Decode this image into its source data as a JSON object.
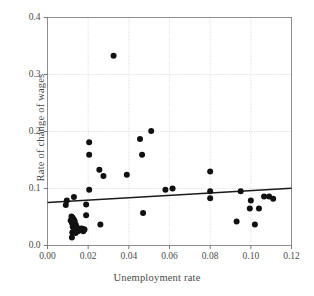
{
  "chart_data": {
    "type": "scatter",
    "title": "",
    "xlabel": "Unemployment rate",
    "ylabel": "Rate of change of wages",
    "xlim": [
      0.0,
      0.12
    ],
    "ylim": [
      0.0,
      0.4
    ],
    "xticks": [
      "0.00",
      "0.02",
      "0.04",
      "0.06",
      "0.08",
      "0.10",
      "0.12"
    ],
    "xtick_values": [
      0.0,
      0.02,
      0.04,
      0.06,
      0.08,
      0.1,
      0.12
    ],
    "yticks": [
      "0.0",
      "0.1",
      "0.2",
      "0.3",
      "0.4"
    ],
    "ytick_values": [
      0.0,
      0.1,
      0.2,
      0.3,
      0.4
    ],
    "grid": true,
    "grid_color": "#cccccc",
    "legend": "none",
    "marker_color": "#111111",
    "marker_size": 3.0,
    "line_color": "#1a1a1a",
    "points": [
      {
        "x": 0.0325,
        "y": 0.333
      },
      {
        "x": 0.0205,
        "y": 0.181
      },
      {
        "x": 0.0205,
        "y": 0.159
      },
      {
        "x": 0.0455,
        "y": 0.187
      },
      {
        "x": 0.0465,
        "y": 0.159
      },
      {
        "x": 0.051,
        "y": 0.201
      },
      {
        "x": 0.0255,
        "y": 0.133
      },
      {
        "x": 0.0275,
        "y": 0.122
      },
      {
        "x": 0.039,
        "y": 0.124
      },
      {
        "x": 0.08,
        "y": 0.13
      },
      {
        "x": 0.0205,
        "y": 0.098
      },
      {
        "x": 0.058,
        "y": 0.098
      },
      {
        "x": 0.0615,
        "y": 0.1
      },
      {
        "x": 0.08,
        "y": 0.095
      },
      {
        "x": 0.095,
        "y": 0.095
      },
      {
        "x": 0.08,
        "y": 0.083
      },
      {
        "x": 0.013,
        "y": 0.085
      },
      {
        "x": 0.0095,
        "y": 0.079
      },
      {
        "x": 0.009,
        "y": 0.071
      },
      {
        "x": 0.019,
        "y": 0.072
      },
      {
        "x": 0.1,
        "y": 0.079
      },
      {
        "x": 0.1065,
        "y": 0.086
      },
      {
        "x": 0.109,
        "y": 0.086
      },
      {
        "x": 0.111,
        "y": 0.082
      },
      {
        "x": 0.0995,
        "y": 0.065
      },
      {
        "x": 0.104,
        "y": 0.065
      },
      {
        "x": 0.019,
        "y": 0.053
      },
      {
        "x": 0.047,
        "y": 0.057
      },
      {
        "x": 0.093,
        "y": 0.042
      },
      {
        "x": 0.102,
        "y": 0.037
      },
      {
        "x": 0.026,
        "y": 0.037
      },
      {
        "x": 0.0118,
        "y": 0.051
      },
      {
        "x": 0.0122,
        "y": 0.049
      },
      {
        "x": 0.0126,
        "y": 0.047
      },
      {
        "x": 0.013,
        "y": 0.045
      },
      {
        "x": 0.0114,
        "y": 0.044
      },
      {
        "x": 0.0134,
        "y": 0.042
      },
      {
        "x": 0.012,
        "y": 0.04
      },
      {
        "x": 0.0128,
        "y": 0.038
      },
      {
        "x": 0.014,
        "y": 0.036
      },
      {
        "x": 0.0124,
        "y": 0.033
      },
      {
        "x": 0.0132,
        "y": 0.031
      },
      {
        "x": 0.0155,
        "y": 0.03
      },
      {
        "x": 0.0168,
        "y": 0.03
      },
      {
        "x": 0.0175,
        "y": 0.029
      },
      {
        "x": 0.0162,
        "y": 0.027
      },
      {
        "x": 0.015,
        "y": 0.025
      },
      {
        "x": 0.0128,
        "y": 0.025
      },
      {
        "x": 0.0176,
        "y": 0.025
      },
      {
        "x": 0.0182,
        "y": 0.028
      },
      {
        "x": 0.0122,
        "y": 0.023
      },
      {
        "x": 0.0138,
        "y": 0.022
      },
      {
        "x": 0.012,
        "y": 0.014
      }
    ],
    "trendline": {
      "x0": 0.0,
      "y0": 0.0755,
      "x1": 0.12,
      "y1": 0.1005
    }
  }
}
